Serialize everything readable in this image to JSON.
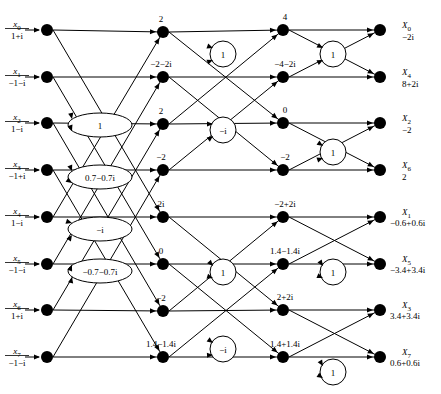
{
  "geometry": {
    "width": 441,
    "height": 394,
    "columns_x": [
      47,
      163,
      283,
      380
    ],
    "twiddle_x": [
      100,
      223,
      333
    ],
    "rows_y": [
      30,
      77,
      123,
      170,
      217,
      264,
      310,
      357
    ],
    "node_radius": 6,
    "twiddle_circle_r": 13,
    "twiddle_ellipse_rx": 32,
    "twiddle_ellipse_ry": 12
  },
  "inputs": [
    {
      "name": "x",
      "index": "0",
      "value": "1+i",
      "y": 30
    },
    {
      "name": "x",
      "index": "1",
      "value": "−1−i",
      "y": 77
    },
    {
      "name": "x",
      "index": "2",
      "value": "1−i",
      "y": 123
    },
    {
      "name": "x",
      "index": "3",
      "value": "−1+i",
      "y": 170
    },
    {
      "name": "x",
      "index": "4",
      "value": "1−i",
      "y": 217
    },
    {
      "name": "x",
      "index": "5",
      "value": "−1−i",
      "y": 264
    },
    {
      "name": "x",
      "index": "6",
      "value": "1+i",
      "y": 310
    },
    {
      "name": "x",
      "index": "7",
      "value": "−1−i",
      "y": 357
    }
  ],
  "stage1_twiddles": [
    {
      "label": "1",
      "y": 125,
      "shape": "ellipse"
    },
    {
      "label": "0.7−0.7i",
      "y": 177,
      "shape": "ellipse"
    },
    {
      "label": "−i",
      "y": 229,
      "shape": "ellipse"
    },
    {
      "label": "−0.7−0.7i",
      "y": 271,
      "shape": "ellipse"
    }
  ],
  "stage2_nodes": [
    {
      "value": "2",
      "y": 32
    },
    {
      "value": "−2−2i",
      "y": 77
    },
    {
      "value": "2",
      "y": 124
    },
    {
      "value": "−2",
      "y": 170
    },
    {
      "value": "2i",
      "y": 217
    },
    {
      "value": "0",
      "y": 264
    },
    {
      "value": "−2",
      "y": 311
    },
    {
      "value": "1.4−1.4i",
      "y": 357
    }
  ],
  "stage2_twiddles": [
    {
      "label": "1",
      "y": 54,
      "shape": "circle"
    },
    {
      "label": "−i",
      "y": 130,
      "shape": "circle"
    },
    {
      "label": "1",
      "y": 272,
      "shape": "circle"
    },
    {
      "label": "−i",
      "y": 349,
      "shape": "circle"
    }
  ],
  "stage3_nodes": [
    {
      "value": "4",
      "y": 30
    },
    {
      "value": "−4−2i",
      "y": 77
    },
    {
      "value": "0",
      "y": 123
    },
    {
      "value": "−2",
      "y": 170
    },
    {
      "value": "−2+2i",
      "y": 217
    },
    {
      "value": "1.4−1.4i",
      "y": 264
    },
    {
      "value": "2+2i",
      "y": 310
    },
    {
      "value": "1.4+1.4i",
      "y": 357
    }
  ],
  "stage3_twiddles": [
    {
      "label": "1",
      "y": 54,
      "shape": "circle"
    },
    {
      "label": "1",
      "y": 152,
      "shape": "circle"
    },
    {
      "label": "1",
      "y": 272,
      "shape": "circle"
    },
    {
      "label": "1",
      "y": 372,
      "shape": "circle"
    }
  ],
  "outputs": [
    {
      "name": "X",
      "index": "0",
      "value": "−2i",
      "y": 30,
      "label_inline": false
    },
    {
      "name": "X",
      "index": "4",
      "value": "8+2i",
      "y": 77,
      "label_inline": false
    },
    {
      "name": "X",
      "index": "2",
      "value": "−2",
      "y": 123,
      "label_inline": false
    },
    {
      "name": "X",
      "index": "6",
      "value": "2",
      "y": 170,
      "label_inline": false
    },
    {
      "name": "X",
      "index": "1",
      "value": "−0.6+0.6i",
      "y": 217,
      "label_inline": true
    },
    {
      "name": "X",
      "index": "5",
      "value": "−3.4+3.4i",
      "y": 264,
      "label_inline": true
    },
    {
      "name": "X",
      "index": "3",
      "value": "3.4+3.4i",
      "y": 310,
      "label_inline": true
    },
    {
      "name": "X",
      "index": "7",
      "value": "0.6+0.6i",
      "y": 357,
      "label_inline": true
    }
  ],
  "edges_stage1": [
    {
      "from": 0,
      "to": 0
    },
    {
      "from": 0,
      "to": 4
    },
    {
      "from": 1,
      "to": 1
    },
    {
      "from": 1,
      "to": 5
    },
    {
      "from": 2,
      "to": 2
    },
    {
      "from": 2,
      "to": 6
    },
    {
      "from": 3,
      "to": 3
    },
    {
      "from": 3,
      "to": 7
    },
    {
      "from": 4,
      "to": 0
    },
    {
      "from": 4,
      "to": 4
    },
    {
      "from": 5,
      "to": 1
    },
    {
      "from": 5,
      "to": 5
    },
    {
      "from": 6,
      "to": 2
    },
    {
      "from": 6,
      "to": 6
    },
    {
      "from": 7,
      "to": 3
    },
    {
      "from": 7,
      "to": 7
    }
  ],
  "edges_stage2": [
    {
      "from": 0,
      "to": 0
    },
    {
      "from": 0,
      "to": 2
    },
    {
      "from": 1,
      "to": 1
    },
    {
      "from": 1,
      "to": 3
    },
    {
      "from": 2,
      "to": 0
    },
    {
      "from": 2,
      "to": 2
    },
    {
      "from": 3,
      "to": 1
    },
    {
      "from": 3,
      "to": 3
    },
    {
      "from": 4,
      "to": 4
    },
    {
      "from": 4,
      "to": 6
    },
    {
      "from": 5,
      "to": 5
    },
    {
      "from": 5,
      "to": 7
    },
    {
      "from": 6,
      "to": 4
    },
    {
      "from": 6,
      "to": 6
    },
    {
      "from": 7,
      "to": 5
    },
    {
      "from": 7,
      "to": 7
    }
  ],
  "edges_stage3": [
    {
      "from": 0,
      "to": 0
    },
    {
      "from": 0,
      "to": 1
    },
    {
      "from": 1,
      "to": 0
    },
    {
      "from": 1,
      "to": 1
    },
    {
      "from": 2,
      "to": 2
    },
    {
      "from": 2,
      "to": 3
    },
    {
      "from": 3,
      "to": 2
    },
    {
      "from": 3,
      "to": 3
    },
    {
      "from": 4,
      "to": 4
    },
    {
      "from": 4,
      "to": 5
    },
    {
      "from": 5,
      "to": 4
    },
    {
      "from": 5,
      "to": 5
    },
    {
      "from": 6,
      "to": 6
    },
    {
      "from": 6,
      "to": 7
    },
    {
      "from": 7,
      "to": 6
    },
    {
      "from": 7,
      "to": 7
    }
  ],
  "stage1_twiddle_inputs": [
    {
      "tw": 0,
      "rows": [
        0,
        1
      ]
    },
    {
      "tw": 1,
      "rows": [
        2,
        3
      ]
    },
    {
      "tw": 2,
      "rows": [
        4,
        5
      ]
    },
    {
      "tw": 3,
      "rows": [
        6,
        7
      ]
    }
  ]
}
